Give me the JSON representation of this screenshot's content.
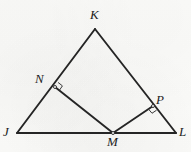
{
  "figure": {
    "kind": "geometry-diagram",
    "canvas": {
      "width": 191,
      "height": 152
    },
    "colors": {
      "background": "#fdfdfc",
      "stroke": "#252525",
      "label": "#1d1d1d",
      "mark": "#3a3a3a"
    },
    "stroke_width": 1.9
  },
  "points": [
    {
      "id": "J",
      "label": "J",
      "x": 17,
      "y": 133,
      "label_x": 3,
      "label_y": 125,
      "on": "triangle-vertex"
    },
    {
      "id": "K",
      "label": "K",
      "x": 95,
      "y": 29,
      "label_x": 90,
      "label_y": 8,
      "on": "triangle-vertex"
    },
    {
      "id": "L",
      "label": "L",
      "x": 176,
      "y": 133,
      "label_x": 179,
      "label_y": 125,
      "on": "triangle-vertex"
    },
    {
      "id": "N",
      "label": "N",
      "x": 55,
      "y": 87,
      "label_x": 35,
      "label_y": 72,
      "on": "segment-JK"
    },
    {
      "id": "P",
      "label": "P",
      "x": 153,
      "y": 106,
      "label_x": 156,
      "label_y": 93,
      "on": "segment-KL"
    },
    {
      "id": "M",
      "label": "M",
      "x": 113,
      "y": 133,
      "label_x": 107,
      "label_y": 135,
      "on": "segment-JL"
    }
  ],
  "segments": [
    {
      "id": "JK",
      "from": "J",
      "to": "K",
      "name": "side-jk"
    },
    {
      "id": "KL",
      "from": "K",
      "to": "L",
      "name": "side-kl"
    },
    {
      "id": "JL",
      "from": "J",
      "to": "L",
      "name": "side-jl"
    },
    {
      "id": "NM",
      "from": "N",
      "to": "M",
      "name": "segment-nm"
    },
    {
      "id": "PM",
      "from": "P",
      "to": "M",
      "name": "segment-pm"
    }
  ],
  "angle_marks": [
    {
      "id": "N",
      "at": "N",
      "type": "right-angle",
      "size": 5.5,
      "rays": [
        "K",
        "M"
      ]
    },
    {
      "id": "P",
      "at": "P",
      "type": "right-angle",
      "size": 5.5,
      "rays": [
        "L",
        "M"
      ]
    }
  ]
}
